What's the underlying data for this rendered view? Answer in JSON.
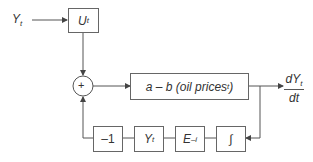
{
  "diagram": {
    "input": {
      "label": "Y",
      "sub": "t"
    },
    "blocks": {
      "u": {
        "label": "U",
        "sub": "t"
      },
      "sum": {
        "label": "+"
      },
      "main": {
        "label_pre": "a – b (oil prices",
        "sub": "t",
        "label_post": ")"
      },
      "neg": {
        "label": "–1"
      },
      "y": {
        "label": "Y",
        "sub": "t"
      },
      "e": {
        "label": "E",
        "sup": "–i"
      },
      "int": {
        "label": "∫"
      }
    },
    "output": {
      "numerator": "dY",
      "num_sub": "t",
      "denominator": "dt"
    },
    "colors": {
      "line": "#555555",
      "box_border": "#666666",
      "text": "#333333"
    }
  }
}
